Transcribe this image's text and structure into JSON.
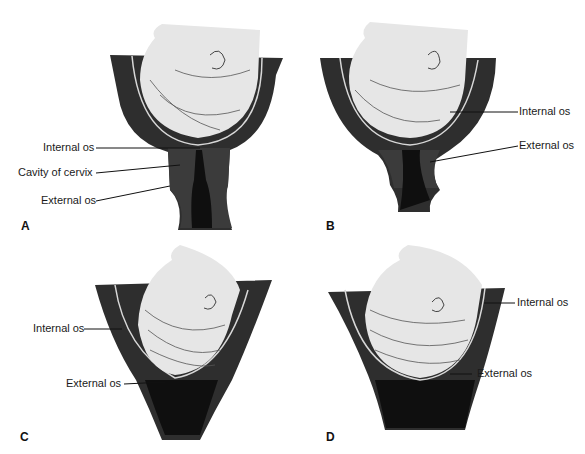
{
  "figure": {
    "colors": {
      "uterine_wall": "#2e2e2e",
      "cervix_tissue": "#3a3a3a",
      "canal": "#111111",
      "fetal_head": "#e6e6e6",
      "membrane_line": "#d8d8d8",
      "text": "#1a1a1a"
    },
    "panels": [
      {
        "letter": "A",
        "labels": [
          "Internal os",
          "Cavity of cervix",
          "External os"
        ]
      },
      {
        "letter": "B",
        "labels": [
          "Internal os",
          "External os"
        ]
      },
      {
        "letter": "C",
        "labels": [
          "Internal os",
          "External os"
        ]
      },
      {
        "letter": "D",
        "labels": [
          "Internal os",
          "External os"
        ]
      }
    ]
  }
}
